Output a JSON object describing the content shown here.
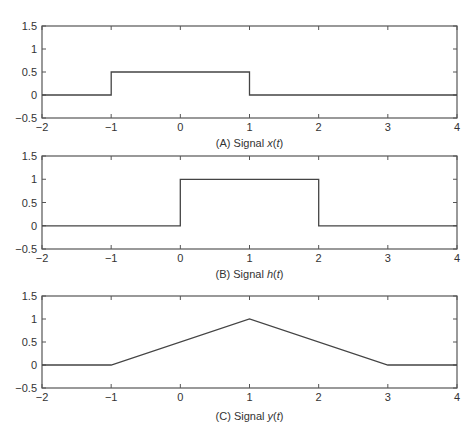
{
  "chart_data": [
    {
      "type": "line",
      "title": "",
      "caption_prefix": "(A) Signal ",
      "caption_var": "x",
      "caption_arg": "t",
      "caption": "(A) Signal x(t)",
      "xlabel": "",
      "ylabel": "",
      "xlim": [
        -2,
        4
      ],
      "ylim": [
        -0.5,
        1.5
      ],
      "xticks": [
        -2,
        -1,
        0,
        1,
        2,
        3,
        4
      ],
      "yticks": [
        -0.5,
        0,
        0.5,
        1,
        1.5
      ],
      "xtick_labels": [
        "−2",
        "−1",
        "0",
        "1",
        "2",
        "3",
        "4"
      ],
      "ytick_labels": [
        "−0.5",
        "0",
        "0.5",
        "1",
        "1.5"
      ],
      "x": [
        -2,
        -1,
        -1,
        1,
        1,
        4
      ],
      "y": [
        0,
        0,
        0.5,
        0.5,
        0,
        0
      ],
      "grid": false
    },
    {
      "type": "line",
      "title": "",
      "caption_prefix": "(B) Signal ",
      "caption_var": "h",
      "caption_arg": "t",
      "caption": "(B) Signal h(t)",
      "xlabel": "",
      "ylabel": "",
      "xlim": [
        -2,
        4
      ],
      "ylim": [
        -0.5,
        1.5
      ],
      "xticks": [
        -2,
        -1,
        0,
        1,
        2,
        3,
        4
      ],
      "yticks": [
        -0.5,
        0,
        0.5,
        1,
        1.5
      ],
      "xtick_labels": [
        "−2",
        "−1",
        "0",
        "1",
        "2",
        "3",
        "4"
      ],
      "ytick_labels": [
        "−0.5",
        "0",
        "0.5",
        "1",
        "1.5"
      ],
      "x": [
        -2,
        0,
        0,
        2,
        2,
        4
      ],
      "y": [
        0,
        0,
        1,
        1,
        0,
        0
      ],
      "grid": false
    },
    {
      "type": "line",
      "title": "",
      "caption_prefix": "(C) Signal ",
      "caption_var": "y",
      "caption_arg": "t",
      "caption": "(C) Signal y(t)",
      "xlabel": "",
      "ylabel": "",
      "xlim": [
        -2,
        4
      ],
      "ylim": [
        -0.5,
        1.5
      ],
      "xticks": [
        -2,
        -1,
        0,
        1,
        2,
        3,
        4
      ],
      "yticks": [
        -0.5,
        0,
        0.5,
        1,
        1.5
      ],
      "xtick_labels": [
        "−2",
        "−1",
        "0",
        "1",
        "2",
        "3",
        "4"
      ],
      "ytick_labels": [
        "−0.5",
        "0",
        "0.5",
        "1",
        "1.5"
      ],
      "x": [
        -2,
        -1,
        1,
        3,
        4
      ],
      "y": [
        0,
        0,
        1,
        0,
        0
      ],
      "grid": false
    }
  ],
  "layout": {
    "panels": [
      {
        "left": 42,
        "right": 457,
        "top": 26,
        "bottom": 118,
        "caption_y": 147
      },
      {
        "left": 42,
        "right": 457,
        "top": 156,
        "bottom": 249,
        "caption_y": 278
      },
      {
        "left": 42,
        "right": 457,
        "top": 296,
        "bottom": 388,
        "caption_y": 420
      }
    ],
    "colors": {
      "line": "#444444",
      "axis": "#555555",
      "text": "#333333"
    }
  }
}
